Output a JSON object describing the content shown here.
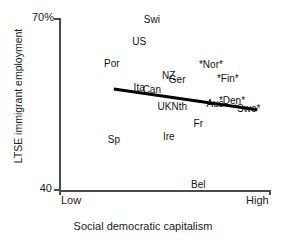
{
  "chart_data": {
    "type": "scatter",
    "title": "",
    "xlabel": "Social democratic capitalism",
    "ylabel": "LTSE immigrant employment",
    "xlim": [
      "Low",
      "High"
    ],
    "ylim": [
      40,
      70
    ],
    "grid": false,
    "legend": "none",
    "marker_style": "text-labels-only",
    "y_ticks": [
      {
        "label": "70%",
        "value": 70
      },
      {
        "label": "40",
        "value": 40
      }
    ],
    "x_ticks": [
      {
        "label": "Low",
        "value": 0
      },
      {
        "label": "High",
        "value": 1
      }
    ],
    "points": [
      {
        "label": "Swi",
        "x": 0.44,
        "y": 69.6
      },
      {
        "label": "US",
        "x": 0.38,
        "y": 65.8
      },
      {
        "label": "Por",
        "x": 0.25,
        "y": 61.9
      },
      {
        "label": "*Nor*",
        "x": 0.72,
        "y": 61.8
      },
      {
        "label": "NZ",
        "x": 0.52,
        "y": 59.9
      },
      {
        "label": "Ger",
        "x": 0.56,
        "y": 59.1
      },
      {
        "label": "*Fin*",
        "x": 0.8,
        "y": 59.3
      },
      {
        "label": "Ita",
        "x": 0.38,
        "y": 57.8
      },
      {
        "label": "Can",
        "x": 0.44,
        "y": 57.4
      },
      {
        "label": "Aus",
        "x": 0.74,
        "y": 55.0
      },
      {
        "label": "*Den*",
        "x": 0.82,
        "y": 55.6
      },
      {
        "label": "*Swe*",
        "x": 0.89,
        "y": 54.2
      },
      {
        "label": "UK",
        "x": 0.5,
        "y": 54.4
      },
      {
        "label": "Nth",
        "x": 0.57,
        "y": 54.4
      },
      {
        "label": "Fr",
        "x": 0.66,
        "y": 51.5
      },
      {
        "label": "Ire",
        "x": 0.52,
        "y": 49.2
      },
      {
        "label": "Sp",
        "x": 0.26,
        "y": 48.7
      },
      {
        "label": "Bel",
        "x": 0.66,
        "y": 40.8
      }
    ],
    "trend_line": {
      "type": "linear-fit",
      "x_start": 0.26,
      "y_start": 57.6,
      "x_end": 0.94,
      "y_end": 54.0,
      "slope_direction": "negative",
      "color": "#000000"
    }
  },
  "axes": {
    "y_title": "LTSE immigrant employment",
    "x_title": "Social democratic capitalism",
    "y_top_label": "70%",
    "y_bottom_label": "40",
    "x_left_label": "Low",
    "x_right_label": "High"
  }
}
